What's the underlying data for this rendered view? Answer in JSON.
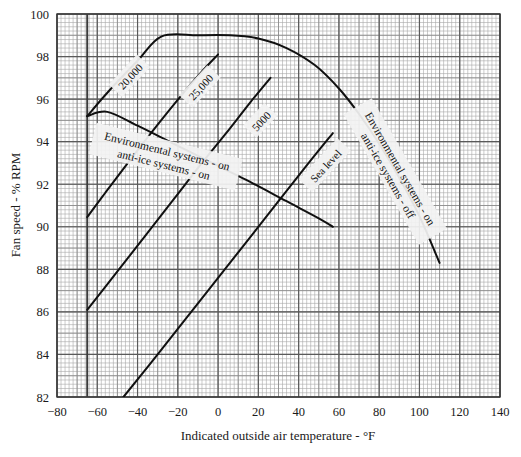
{
  "chart_data": {
    "type": "line",
    "title": "",
    "xlabel": "Indicated outside air temperature - °F",
    "ylabel": "Fan speed - % RPM",
    "xlim": [
      -80,
      140
    ],
    "ylim": [
      82,
      100
    ],
    "xticks": [
      -80,
      -60,
      -40,
      -20,
      0,
      20,
      40,
      60,
      80,
      100,
      120,
      140
    ],
    "xtick_labels": [
      "−80",
      "−60",
      "−40",
      "−20",
      "0",
      "20",
      "40",
      "60",
      "80",
      "100",
      "120",
      "140"
    ],
    "yticks": [
      82,
      84,
      86,
      88,
      90,
      92,
      94,
      96,
      98,
      100
    ],
    "ytick_labels": [
      "82",
      "84",
      "86",
      "88",
      "90",
      "92",
      "94",
      "96",
      "98",
      "100"
    ],
    "grid": "major-and-minor",
    "grid_minor_x_step": 2,
    "grid_minor_y_step": 0.2,
    "legend_position": "inline-annotations",
    "series": [
      {
        "name": "20,000",
        "label": "20,000",
        "label_x": -44,
        "label_y": 97.1,
        "label_rotation": -47,
        "points": [
          [
            -65,
            95.2
          ],
          [
            -55,
            96.3
          ],
          [
            -40,
            97.8
          ],
          [
            -28,
            98.95
          ],
          [
            -10,
            99.0
          ],
          [
            6,
            99.0
          ],
          [
            20,
            98.85
          ],
          [
            34,
            98.4
          ],
          [
            48,
            97.6
          ],
          [
            60,
            96.5
          ],
          [
            70,
            95.3
          ],
          [
            80,
            93.9
          ],
          [
            90,
            92.3
          ],
          [
            100,
            90.5
          ],
          [
            110,
            88.3
          ]
        ]
      },
      {
        "name": "25,000",
        "label": "25,000",
        "label_x": -9,
        "label_y": 96.6,
        "label_rotation": -47,
        "points": [
          [
            -65,
            90.45
          ],
          [
            -56,
            91.6
          ],
          [
            -44,
            93.1
          ],
          [
            -30,
            94.8
          ],
          [
            -18,
            96.2
          ],
          [
            -8,
            97.3
          ],
          [
            0,
            98.1
          ]
        ]
      },
      {
        "name": "5000",
        "label": "5000",
        "label_x": 21,
        "label_y": 95.0,
        "label_rotation": -47,
        "points": [
          [
            -65,
            86.1
          ],
          [
            -50,
            87.9
          ],
          [
            -36,
            89.6
          ],
          [
            -22,
            91.3
          ],
          [
            -8,
            93.0
          ],
          [
            4,
            94.4
          ],
          [
            16,
            95.85
          ],
          [
            26,
            97.0
          ]
        ]
      },
      {
        "name": "Sea level",
        "label": "Sea level",
        "label_x": 53,
        "label_y": 92.9,
        "label_rotation": -47,
        "points": [
          [
            -47,
            82.0
          ],
          [
            -30,
            84.0
          ],
          [
            -10,
            86.4
          ],
          [
            10,
            88.8
          ],
          [
            30,
            91.2
          ],
          [
            45,
            93.0
          ],
          [
            57,
            94.4
          ]
        ]
      },
      {
        "name": "environmental-on-anti-ice-on-boundary",
        "label": "",
        "points": [
          [
            -65,
            95.2
          ],
          [
            -55,
            95.4
          ],
          [
            -40,
            94.75
          ],
          [
            -22,
            93.9
          ],
          [
            -4,
            93.05
          ],
          [
            14,
            92.2
          ],
          [
            34,
            91.2
          ],
          [
            50,
            90.4
          ],
          [
            57,
            90.0
          ]
        ]
      }
    ],
    "annotations": [
      {
        "name": "environmental-on-anti-ice-on",
        "lines": [
          "Environmental systems - on",
          "anti-ice systems - on"
        ],
        "x": -26,
        "y": 93.3,
        "rotation": 14
      },
      {
        "name": "environmental-on-anti-ice-off",
        "lines": [
          "Environmental systems - on",
          "anti-ice systems - off"
        ],
        "x": 88,
        "y": 92.6,
        "rotation": 60
      }
    ],
    "reference_lines": [
      {
        "name": "left-limit-line",
        "orientation": "vertical",
        "x": -65
      }
    ]
  },
  "colors": {
    "ink": "#1a1a1a",
    "curve": "#101010",
    "grid_major": "#5a5a5a",
    "grid_minor": "#a8a8a8",
    "background": "#ffffff",
    "label_box": "#f2f2f2"
  }
}
